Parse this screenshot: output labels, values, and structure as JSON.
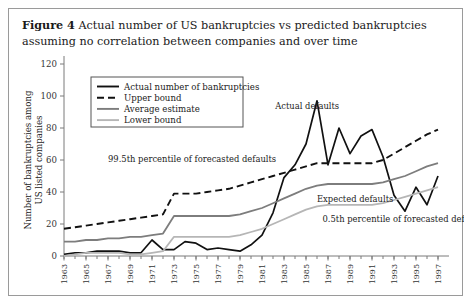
{
  "figure": {
    "number_label": "Figure 4",
    "caption": "Actual number of US bankruptcies vs predicted bankruptcies assuming no correlation between companies and over time"
  },
  "chart_data": {
    "type": "line",
    "title": "",
    "xlabel": "",
    "ylabel": "Number of bankruptcies among US listed companies",
    "ylabel_line1": "Number of bankruptcies among",
    "ylabel_line2": "US listed companies",
    "ylim": [
      0,
      120
    ],
    "yticks": [
      0,
      20,
      40,
      60,
      80,
      100,
      120
    ],
    "xlim": [
      1963,
      1998
    ],
    "x": [
      1963,
      1964,
      1965,
      1966,
      1967,
      1968,
      1969,
      1970,
      1971,
      1972,
      1973,
      1974,
      1975,
      1976,
      1977,
      1978,
      1979,
      1980,
      1981,
      1982,
      1983,
      1984,
      1985,
      1986,
      1987,
      1988,
      1989,
      1990,
      1991,
      1992,
      1993,
      1994,
      1995,
      1996,
      1997
    ],
    "xticks": [
      1963,
      1965,
      1967,
      1969,
      1971,
      1973,
      1975,
      1977,
      1979,
      1981,
      1983,
      1985,
      1987,
      1989,
      1991,
      1993,
      1995,
      1997
    ],
    "xticklabels": [
      "1963",
      "1965",
      "1967",
      "1969",
      "1971",
      "1973",
      "1975",
      "1977",
      "1979",
      "1981",
      "1983",
      "1985",
      "1987",
      "1989",
      "1991",
      "1993",
      "1995",
      "1997"
    ],
    "grid": false,
    "legend_position": "top-left",
    "series": [
      {
        "name": "Actual number of bankruptcies",
        "key": "actual",
        "color": "#111111",
        "style": "solid",
        "values": [
          1,
          2,
          2,
          3,
          3,
          3,
          2,
          2,
          10,
          4,
          4,
          9,
          8,
          4,
          5,
          4,
          3,
          7,
          13,
          27,
          49,
          57,
          70,
          97,
          57,
          80,
          64,
          75,
          79,
          62,
          38,
          28,
          43,
          32,
          50
        ]
      },
      {
        "name": "Upper bound",
        "key": "upper",
        "color": "#111111",
        "style": "dashed",
        "values": [
          17,
          18,
          19,
          20,
          21,
          22,
          23,
          24,
          25,
          26,
          39,
          39,
          39,
          40,
          41,
          42,
          44,
          46,
          48,
          50,
          52,
          54,
          56,
          58,
          58,
          58,
          58,
          58,
          58,
          60,
          64,
          68,
          72,
          76,
          79
        ]
      },
      {
        "name": "Average estimate",
        "key": "average",
        "color": "#7d7d7d",
        "style": "solid",
        "values": [
          9,
          9,
          10,
          10,
          11,
          11,
          12,
          12,
          13,
          14,
          25,
          25,
          25,
          25,
          25,
          25,
          26,
          28,
          30,
          33,
          36,
          39,
          42,
          44,
          45,
          45,
          45,
          45,
          45,
          46,
          48,
          50,
          53,
          56,
          58
        ]
      },
      {
        "name": "Lower bound",
        "key": "lower",
        "color": "#b6b6b6",
        "style": "solid",
        "values": [
          0,
          1,
          2,
          2,
          2,
          2,
          1,
          1,
          2,
          3,
          12,
          12,
          12,
          12,
          12,
          12,
          13,
          15,
          17,
          20,
          23,
          26,
          29,
          31,
          32,
          32,
          32,
          32,
          32,
          33,
          35,
          37,
          39,
          41,
          43
        ]
      }
    ],
    "annotations": [
      {
        "text": "Actual defaults",
        "x": 1982.2,
        "y": 92
      },
      {
        "text": "99.5th percentile of forecasted defaults",
        "x": 1967.0,
        "y": 59
      },
      {
        "text": "Expected defaults",
        "x": 1986.0,
        "y": 34
      },
      {
        "text": "0.5th percentile of forecasted defaults",
        "x": 1986.5,
        "y": 21
      }
    ]
  }
}
